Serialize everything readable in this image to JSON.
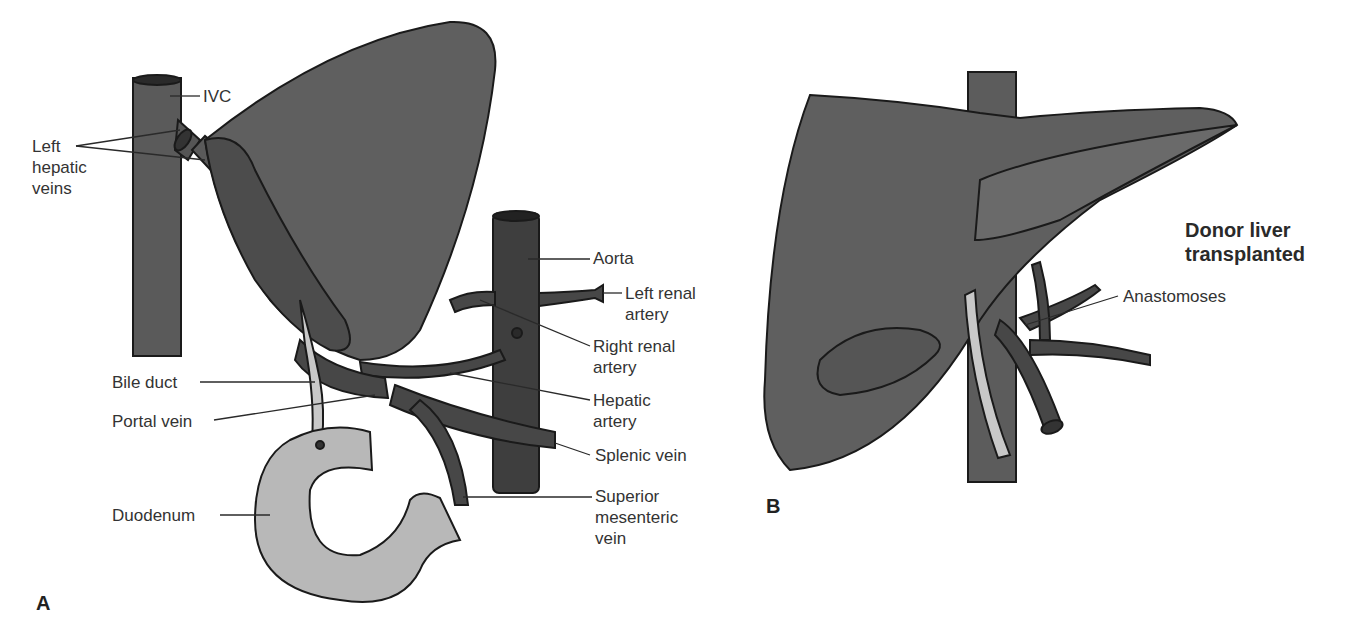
{
  "colors": {
    "organ": "#5f5f5f",
    "organ_dark": "#4a4a4a",
    "vessel": "#474747",
    "aorta": "#3e3e3e",
    "duct": "#c8c8c8",
    "duodenum": "#b8b8b8",
    "outline": "#1a1a1a",
    "background": "#ffffff"
  },
  "panel_a": {
    "letter": "A",
    "labels": {
      "ivc": "IVC",
      "left_hepatic_veins": "Left\nhepatic\nveins",
      "aorta": "Aorta",
      "left_renal_artery": "Left renal\nartery",
      "right_renal_artery": "Right renal\nartery",
      "hepatic_artery": "Hepatic\nartery",
      "splenic_vein": "Splenic vein",
      "superior_mesenteric_vein": "Superior\nmesenteric\nvein",
      "bile_duct": "Bile duct",
      "portal_vein": "Portal vein",
      "duodenum": "Duodenum"
    }
  },
  "panel_b": {
    "letter": "B",
    "title": "Donor liver\ntransplanted",
    "labels": {
      "anastomoses": "Anastomoses"
    }
  }
}
